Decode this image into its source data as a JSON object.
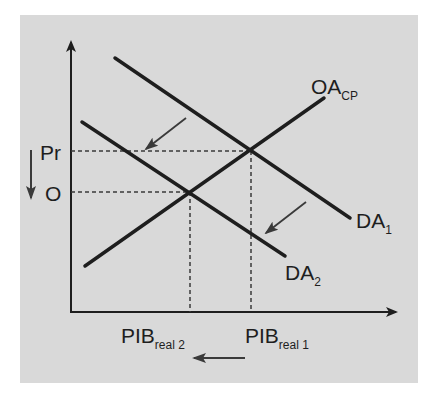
{
  "diagram": {
    "type": "aggregate-demand-supply-shift",
    "background_color": "#d9d9d9",
    "line_color": "#1e1e1e",
    "arrow_color": "#3a3a3a",
    "y_axis": {
      "ticks": [
        {
          "label": "Pr",
          "position": "upper"
        },
        {
          "label": "O",
          "position": "lower"
        }
      ],
      "shift_arrow_direction": "down"
    },
    "x_axis": {
      "ticks": [
        {
          "label": "PIB",
          "sub": "real 2",
          "position": "left"
        },
        {
          "label": "PIB",
          "sub": "real 1",
          "position": "right"
        }
      ],
      "shift_arrow_direction": "left"
    },
    "curves": [
      {
        "id": "OA",
        "label": "OA",
        "sub": "CP",
        "slope": "upward"
      },
      {
        "id": "DA1",
        "label": "DA",
        "sub": "1",
        "slope": "downward"
      },
      {
        "id": "DA2",
        "label": "DA",
        "sub": "2",
        "slope": "downward"
      }
    ],
    "shift_arrows": [
      {
        "from": "DA1",
        "to": "DA2",
        "position": "upper-left"
      },
      {
        "from": "DA1",
        "to": "DA2",
        "position": "lower-right"
      }
    ]
  }
}
